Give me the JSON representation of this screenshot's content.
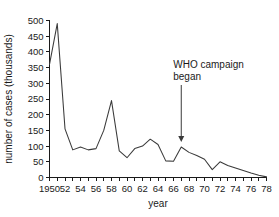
{
  "chart_data": {
    "type": "line",
    "title": "",
    "xlabel": "year",
    "ylabel": "number of cases (thousands)",
    "xlim": [
      1950,
      1978
    ],
    "ylim": [
      0,
      500
    ],
    "grid": false,
    "legend": "none",
    "y_ticks": [
      0,
      50,
      100,
      150,
      200,
      250,
      300,
      350,
      400,
      450,
      500
    ],
    "y_tick_labels": [
      "0",
      "50",
      "100",
      "150",
      "200",
      "250",
      "300",
      "350",
      "400",
      "450",
      "500"
    ],
    "x_ticks": [
      1950,
      1951,
      1952,
      1953,
      1954,
      1955,
      1956,
      1957,
      1958,
      1959,
      1960,
      1961,
      1962,
      1963,
      1964,
      1965,
      1966,
      1967,
      1968,
      1969,
      1970,
      1971,
      1972,
      1973,
      1974,
      1975,
      1976,
      1977,
      1978
    ],
    "x_tick_labels": [
      "1950",
      "52",
      "54",
      "56",
      "58",
      "60",
      "62",
      "64",
      "66",
      "68",
      "70",
      "72",
      "74",
      "76",
      "78"
    ],
    "x_labeled_ticks": [
      1950,
      1952,
      1954,
      1956,
      1958,
      1960,
      1962,
      1964,
      1966,
      1968,
      1970,
      1972,
      1974,
      1976,
      1978
    ],
    "x": [
      1950,
      1951,
      1952,
      1953,
      1954,
      1955,
      1956,
      1957,
      1958,
      1959,
      1960,
      1961,
      1962,
      1963,
      1964,
      1965,
      1966,
      1967,
      1968,
      1969,
      1970,
      1971,
      1972,
      1973,
      1974,
      1975,
      1976,
      1977,
      1978
    ],
    "values": [
      360,
      490,
      155,
      88,
      97,
      88,
      92,
      150,
      245,
      85,
      63,
      92,
      100,
      122,
      105,
      53,
      52,
      97,
      80,
      70,
      58,
      25,
      50,
      38,
      30,
      22,
      14,
      7,
      2
    ],
    "series": [
      {
        "name": "number of cases",
        "values": [
          360,
          490,
          155,
          88,
          97,
          88,
          92,
          150,
          245,
          85,
          63,
          92,
          100,
          122,
          105,
          53,
          52,
          97,
          80,
          70,
          58,
          25,
          50,
          38,
          30,
          22,
          14,
          7,
          2
        ]
      }
    ],
    "annotations": [
      {
        "text_line1": "WHO campaign",
        "text_line2": "began",
        "arrow_year": 1967,
        "arrow_points_to": 97
      }
    ],
    "line_color": "#3a3a3a",
    "axis_color": "#1a1a1a",
    "background_color": "#ffffff"
  }
}
